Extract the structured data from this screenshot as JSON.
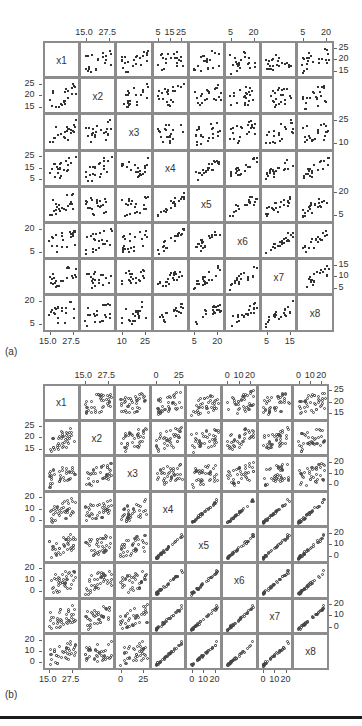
{
  "chart_data": [
    {
      "panel": "(a)",
      "type": "scatter",
      "title": "",
      "variables": [
        "x1",
        "x2",
        "x3",
        "x4",
        "x5",
        "x6",
        "x7",
        "x8"
      ],
      "marker": "filled-square",
      "layout": {
        "left": 43,
        "top": 41,
        "cell": 36.2,
        "n": 8
      },
      "top_axis": [
        {
          "col": 1,
          "ticks": [
            "15.0",
            "27.5"
          ]
        },
        {
          "col": 3,
          "ticks": [
            "5",
            "15",
            "25"
          ]
        },
        {
          "col": 5,
          "ticks": [
            "5",
            "20"
          ]
        },
        {
          "col": 7,
          "ticks": [
            "5",
            "20"
          ]
        }
      ],
      "right_axis": [
        {
          "row": 0,
          "ticks": [
            "25",
            "20",
            "15"
          ]
        },
        {
          "row": 2,
          "ticks": [
            "25",
            "10"
          ]
        },
        {
          "row": 4,
          "ticks": [
            "20",
            "5"
          ]
        },
        {
          "row": 6,
          "ticks": [
            "15",
            "10",
            "5"
          ]
        }
      ],
      "left_axis": [
        {
          "row": 1,
          "ticks": [
            "25",
            "20",
            "15"
          ]
        },
        {
          "row": 3,
          "ticks": [
            "25",
            "15",
            "5"
          ]
        },
        {
          "row": 5,
          "ticks": [
            "20",
            "5"
          ]
        },
        {
          "row": 7,
          "ticks": [
            "20",
            "5"
          ]
        }
      ],
      "bottom_axis": [
        {
          "col": 0,
          "ticks": [
            "15.0",
            "27.5"
          ]
        },
        {
          "col": 2,
          "ticks": [
            "10",
            "25"
          ]
        },
        {
          "col": 4,
          "ticks": [
            "5",
            "20"
          ]
        },
        {
          "col": 6,
          "ticks": [
            "5",
            "15"
          ]
        }
      ],
      "approx_correlation": "moderate positive among x4-x8; weak with x1-x3",
      "n_points_per_panel": 22
    },
    {
      "panel": "(b)",
      "type": "scatter",
      "title": "",
      "variables": [
        "x1",
        "x2",
        "x3",
        "x4",
        "x5",
        "x6",
        "x7",
        "x8"
      ],
      "marker": "open-circle",
      "layout": {
        "left": 43,
        "top": 384,
        "cell": 35.6,
        "n": 8
      },
      "top_axis": [
        {
          "col": 1,
          "ticks": [
            "15.0",
            "27.5"
          ]
        },
        {
          "col": 3,
          "ticks": [
            "0",
            "25"
          ]
        },
        {
          "col": 5,
          "ticks": [
            "0",
            "10",
            "20"
          ]
        },
        {
          "col": 7,
          "ticks": [
            "0",
            "10",
            "20"
          ]
        }
      ],
      "right_axis": [
        {
          "row": 0,
          "ticks": [
            "25",
            "20",
            "15"
          ]
        },
        {
          "row": 2,
          "ticks": [
            "20",
            "10",
            "0"
          ]
        },
        {
          "row": 4,
          "ticks": [
            "20",
            "10",
            "0"
          ]
        },
        {
          "row": 6,
          "ticks": [
            "20",
            "10",
            "0"
          ]
        }
      ],
      "left_axis": [
        {
          "row": 1,
          "ticks": [
            "25",
            "20",
            "15"
          ]
        },
        {
          "row": 3,
          "ticks": [
            "20",
            "10",
            "0"
          ]
        },
        {
          "row": 5,
          "ticks": [
            "20",
            "10",
            "0"
          ]
        },
        {
          "row": 7,
          "ticks": [
            "20",
            "10",
            "0"
          ]
        }
      ],
      "bottom_axis": [
        {
          "col": 0,
          "ticks": [
            "15.0",
            "27.5"
          ]
        },
        {
          "col": 2,
          "ticks": [
            "0",
            "25"
          ]
        },
        {
          "col": 4,
          "ticks": [
            "0",
            "10",
            "20"
          ]
        },
        {
          "col": 6,
          "ticks": [
            "0",
            "10",
            "20"
          ]
        }
      ],
      "approx_correlation": "strong positive among x4-x8 with outliers near top-right; weak with x1-x3",
      "n_points_per_panel": 40
    }
  ],
  "labels": {
    "panel_a": "(a)",
    "panel_b": "(b)"
  }
}
